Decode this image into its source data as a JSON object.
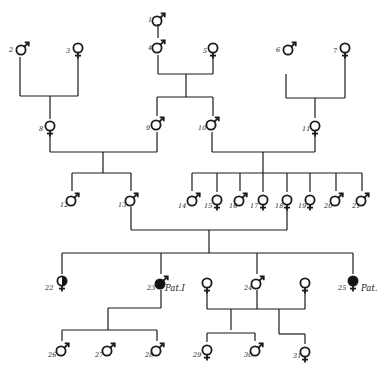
{
  "diagram": {
    "type": "pedigree",
    "individuals": [
      {
        "id": "1",
        "sex": "male",
        "affected": "none",
        "x": 158,
        "y": 18
      },
      {
        "id": "2",
        "sex": "male",
        "affected": "none",
        "x": 22,
        "y": 47
      },
      {
        "id": "3",
        "sex": "female",
        "affected": "none",
        "x": 78,
        "y": 48
      },
      {
        "id": "4",
        "sex": "male",
        "affected": "none",
        "x": 158,
        "y": 45
      },
      {
        "id": "5",
        "sex": "female",
        "affected": "none",
        "x": 213,
        "y": 48
      },
      {
        "id": "6",
        "sex": "male",
        "affected": "none",
        "x": 289,
        "y": 47
      },
      {
        "id": "7",
        "sex": "female",
        "affected": "none",
        "x": 345,
        "y": 48
      },
      {
        "id": "8",
        "sex": "female",
        "affected": "none",
        "x": 50,
        "y": 126
      },
      {
        "id": "9",
        "sex": "male",
        "affected": "none",
        "x": 157,
        "y": 122
      },
      {
        "id": "10",
        "sex": "male",
        "affected": "none",
        "x": 212,
        "y": 122
      },
      {
        "id": "11",
        "sex": "female",
        "affected": "none",
        "x": 315,
        "y": 126
      },
      {
        "id": "12",
        "sex": "male",
        "affected": "none",
        "x": 72,
        "y": 198
      },
      {
        "id": "13",
        "sex": "male",
        "affected": "none",
        "x": 131,
        "y": 198
      },
      {
        "id": "14",
        "sex": "male",
        "affected": "none",
        "x": 193,
        "y": 198
      },
      {
        "id": "15",
        "sex": "female",
        "affected": "none",
        "x": 217,
        "y": 200
      },
      {
        "id": "16",
        "sex": "male",
        "affected": "none",
        "x": 240,
        "y": 198
      },
      {
        "id": "17",
        "sex": "female",
        "affected": "none",
        "x": 263,
        "y": 200
      },
      {
        "id": "18",
        "sex": "female",
        "affected": "none",
        "x": 287,
        "y": 200
      },
      {
        "id": "19",
        "sex": "female",
        "affected": "none",
        "x": 310,
        "y": 200
      },
      {
        "id": "20",
        "sex": "male",
        "affected": "none",
        "x": 336,
        "y": 198
      },
      {
        "id": "21",
        "sex": "male",
        "affected": "none",
        "x": 362,
        "y": 198
      },
      {
        "id": "22",
        "sex": "female",
        "affected": "half",
        "x": 62,
        "y": 281
      },
      {
        "id": "23",
        "sex": "male",
        "affected": "full",
        "x": 161,
        "y": 281,
        "note": "Pat.I"
      },
      {
        "id": "",
        "sex": "female",
        "affected": "none",
        "x": 207,
        "y": 283
      },
      {
        "id": "24",
        "sex": "male",
        "affected": "none",
        "x": 257,
        "y": 281
      },
      {
        "id": "",
        "sex": "female",
        "affected": "none",
        "x": 305,
        "y": 283
      },
      {
        "id": "25",
        "sex": "female",
        "affected": "full",
        "x": 353,
        "y": 281,
        "note": "Pat."
      },
      {
        "id": "26",
        "sex": "male",
        "affected": "none",
        "x": 62,
        "y": 348
      },
      {
        "id": "27",
        "sex": "male",
        "affected": "none",
        "x": 108,
        "y": 348
      },
      {
        "id": "28",
        "sex": "male",
        "affected": "none",
        "x": 157,
        "y": 348
      },
      {
        "id": "29",
        "sex": "female",
        "affected": "none",
        "x": 207,
        "y": 350
      },
      {
        "id": "30",
        "sex": "male",
        "affected": "none",
        "x": 256,
        "y": 348
      },
      {
        "id": "31",
        "sex": "female",
        "affected": "none",
        "x": 305,
        "y": 352
      }
    ],
    "lines": [
      [
        158,
        24,
        158,
        38
      ],
      [
        20,
        57,
        20,
        96
      ],
      [
        20,
        96,
        78,
        96
      ],
      [
        78,
        96,
        78,
        57
      ],
      [
        50,
        96,
        50,
        119
      ],
      [
        158,
        55,
        158,
        74
      ],
      [
        158,
        74,
        213,
        74
      ],
      [
        213,
        74,
        213,
        57
      ],
      [
        186,
        74,
        186,
        97
      ],
      [
        157,
        97,
        213,
        97
      ],
      [
        157,
        97,
        157,
        116
      ],
      [
        213,
        97,
        213,
        116
      ],
      [
        286,
        74,
        286,
        98
      ],
      [
        286,
        98,
        345,
        98
      ],
      [
        345,
        98,
        345,
        57
      ],
      [
        315,
        98,
        315,
        118
      ],
      [
        50,
        135,
        50,
        152
      ],
      [
        50,
        152,
        157,
        152
      ],
      [
        157,
        152,
        157,
        132
      ],
      [
        103,
        152,
        103,
        173
      ],
      [
        72,
        173,
        131,
        173
      ],
      [
        72,
        173,
        72,
        191
      ],
      [
        131,
        173,
        131,
        191
      ],
      [
        212,
        132,
        212,
        152
      ],
      [
        212,
        152,
        315,
        152
      ],
      [
        315,
        152,
        315,
        135
      ],
      [
        263,
        152,
        263,
        173
      ],
      [
        192,
        173,
        362,
        173
      ],
      [
        192,
        173,
        192,
        191
      ],
      [
        217,
        173,
        217,
        192
      ],
      [
        240,
        173,
        240,
        191
      ],
      [
        263,
        173,
        263,
        192
      ],
      [
        287,
        173,
        287,
        192
      ],
      [
        310,
        173,
        310,
        192
      ],
      [
        336,
        173,
        336,
        191
      ],
      [
        362,
        173,
        362,
        191
      ],
      [
        131,
        207,
        131,
        230
      ],
      [
        131,
        230,
        287,
        230
      ],
      [
        287,
        230,
        287,
        210
      ],
      [
        209,
        230,
        209,
        253
      ],
      [
        62,
        253,
        353,
        253
      ],
      [
        62,
        253,
        62,
        274
      ],
      [
        161,
        253,
        161,
        274
      ],
      [
        257,
        253,
        257,
        274
      ],
      [
        353,
        253,
        353,
        274
      ],
      [
        161,
        290,
        161,
        308
      ],
      [
        161,
        308,
        108,
        308
      ],
      [
        108,
        308,
        108,
        330
      ],
      [
        62,
        330,
        157,
        330
      ],
      [
        62,
        330,
        62,
        341
      ],
      [
        157,
        330,
        157,
        341
      ],
      [
        207,
        292,
        207,
        309
      ],
      [
        207,
        309,
        305,
        309
      ],
      [
        305,
        309,
        305,
        292
      ],
      [
        257,
        290,
        257,
        309
      ],
      [
        231,
        309,
        231,
        330
      ],
      [
        207,
        333,
        255,
        333
      ],
      [
        207,
        333,
        207,
        342
      ],
      [
        255,
        333,
        255,
        341
      ],
      [
        279,
        309,
        279,
        334
      ],
      [
        279,
        334,
        305,
        334
      ],
      [
        305,
        334,
        305,
        344
      ]
    ],
    "labels": [
      {
        "text": "1",
        "x": 148,
        "y": 22
      },
      {
        "text": "2",
        "x": 9,
        "y": 52
      },
      {
        "text": "3",
        "x": 66,
        "y": 53
      },
      {
        "text": "4",
        "x": 148,
        "y": 50
      },
      {
        "text": "5",
        "x": 203,
        "y": 53
      },
      {
        "text": "6",
        "x": 276,
        "y": 52
      },
      {
        "text": "7",
        "x": 333,
        "y": 53
      },
      {
        "text": "8",
        "x": 39,
        "y": 131
      },
      {
        "text": "9",
        "x": 146,
        "y": 130
      },
      {
        "text": "10",
        "x": 198,
        "y": 130
      },
      {
        "text": "11",
        "x": 302,
        "y": 131
      },
      {
        "text": "12",
        "x": 60,
        "y": 207
      },
      {
        "text": "13",
        "x": 118,
        "y": 207
      },
      {
        "text": "14",
        "x": 178,
        "y": 208
      },
      {
        "text": "15",
        "x": 204,
        "y": 208
      },
      {
        "text": "16",
        "x": 229,
        "y": 208
      },
      {
        "text": "17",
        "x": 250,
        "y": 208
      },
      {
        "text": "18",
        "x": 275,
        "y": 208
      },
      {
        "text": "19",
        "x": 298,
        "y": 208
      },
      {
        "text": "20",
        "x": 324,
        "y": 208
      },
      {
        "text": "21",
        "x": 352,
        "y": 208
      },
      {
        "text": "22",
        "x": 45,
        "y": 290
      },
      {
        "text": "23",
        "x": 147,
        "y": 290
      },
      {
        "text": "24",
        "x": 244,
        "y": 290
      },
      {
        "text": "25",
        "x": 338,
        "y": 290
      },
      {
        "text": "26",
        "x": 48,
        "y": 357
      },
      {
        "text": "27",
        "x": 95,
        "y": 357
      },
      {
        "text": "28",
        "x": 145,
        "y": 357
      },
      {
        "text": "29",
        "x": 193,
        "y": 357
      },
      {
        "text": "30",
        "x": 244,
        "y": 357
      },
      {
        "text": "31",
        "x": 293,
        "y": 358
      }
    ],
    "notes": [
      {
        "text": "Pat.I",
        "x": 165,
        "y": 291
      },
      {
        "text": "Pat.",
        "x": 361,
        "y": 291
      }
    ]
  }
}
